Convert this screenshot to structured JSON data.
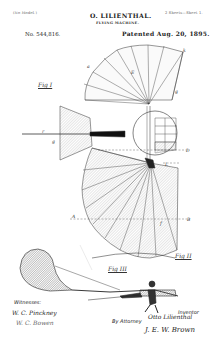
{
  "header": {
    "model_note": "(No Model.)",
    "inventor": "O. LILIENTHAL.",
    "invention": "FLYING MACHINE.",
    "sheets": "2 Sheets—Sheet 1.",
    "patent_no": "No. 544,816.",
    "patented": "Patented Aug. 20, 1895."
  },
  "figures": {
    "fig1": "Fig I",
    "fig2": "Fig II",
    "fig3": "Fig III"
  },
  "reference_letters": {
    "k": "k",
    "a": "a",
    "E": "E",
    "g": "g",
    "r": "r",
    "d": "d",
    "D": "D",
    "L": "L",
    "A": "A",
    "B": "B",
    "f": "f"
  },
  "footer": {
    "witnesses_label": "Witnesses:",
    "witness1": "W. C. Pinckney",
    "witness2": "W. C. Bowen",
    "by_attorney": "By Attorney",
    "inventor_label": "Inventor",
    "inventor_signature": "Otto Lilienthal",
    "attorney_signature": "J. E. W. Brown"
  }
}
